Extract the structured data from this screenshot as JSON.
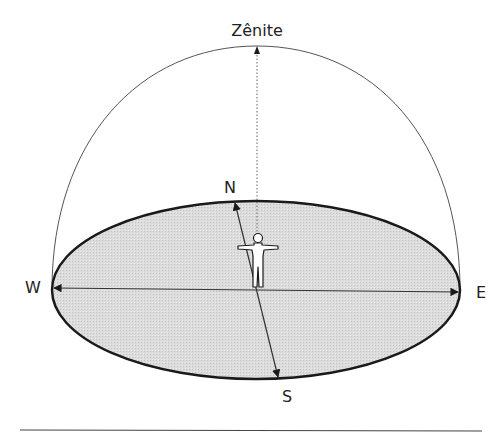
{
  "labels": {
    "zenith": "Zênite",
    "north": "N",
    "south": "S",
    "west": "W",
    "east": "E"
  },
  "colors": {
    "stroke": "#1a1a1a",
    "fill": "#d9d9d9",
    "dome": "#555555",
    "text": "#222222"
  }
}
